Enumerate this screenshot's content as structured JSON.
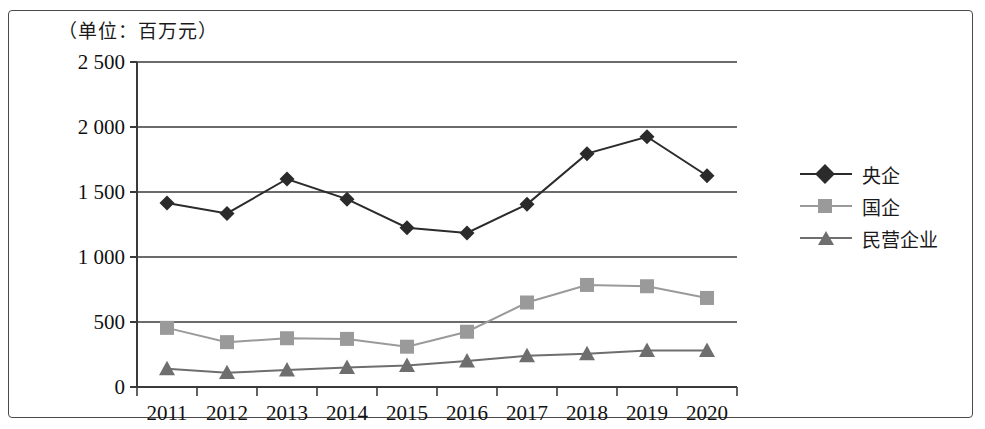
{
  "unit_note": "（单位：百万元）",
  "colors": {
    "series_yangqi": "#2b2b2b",
    "series_guoqi": "#9a9a9a",
    "series_minying": "#6e6e6e",
    "gridline": "#3a3a3a",
    "frame": "#4a4a4a",
    "text": "#111111"
  },
  "legend": {
    "position": "right",
    "items": [
      {
        "label": "央企",
        "marker": "diamond",
        "color": "#2b2b2b"
      },
      {
        "label": "国企",
        "marker": "square",
        "color": "#9a9a9a"
      },
      {
        "label": "民营企业",
        "marker": "triangle",
        "color": "#6e6e6e"
      }
    ]
  },
  "chart_data": {
    "type": "line",
    "title": "（单位：百万元）",
    "xlabel": "",
    "ylabel": "",
    "ylim": [
      0,
      2500
    ],
    "ytick_labels": [
      "0",
      "500",
      "1 000",
      "1 500",
      "2 000",
      "2 500"
    ],
    "yticks": [
      0,
      500,
      1000,
      1500,
      2000,
      2500
    ],
    "grid": true,
    "legend_position": "right",
    "categories": [
      "2011",
      "2012",
      "2013",
      "2014",
      "2015",
      "2016",
      "2017",
      "2018",
      "2019",
      "2020"
    ],
    "series": [
      {
        "name": "央企",
        "marker": "diamond",
        "color": "#2b2b2b",
        "values": [
          1415,
          1335,
          1600,
          1445,
          1225,
          1185,
          1405,
          1795,
          1925,
          1625
        ]
      },
      {
        "name": "国企",
        "marker": "square",
        "color": "#9a9a9a",
        "values": [
          455,
          345,
          375,
          370,
          310,
          425,
          650,
          785,
          775,
          685
        ]
      },
      {
        "name": "民营企业",
        "marker": "triangle",
        "color": "#6e6e6e",
        "values": [
          140,
          110,
          130,
          150,
          165,
          200,
          240,
          255,
          280,
          280
        ]
      }
    ]
  }
}
